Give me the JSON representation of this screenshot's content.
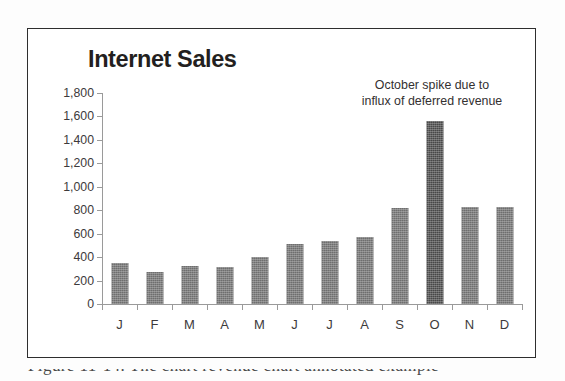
{
  "figure": {
    "frame_color": "#2e2e2e",
    "background": "#ffffff"
  },
  "caption": {
    "text": "Figure 11-14. The chart revenue chart annotated example"
  },
  "chart_data": {
    "type": "bar",
    "title": "Internet Sales",
    "xlabel": "",
    "ylabel": "",
    "categories": [
      "J",
      "F",
      "M",
      "A",
      "M",
      "J",
      "J",
      "A",
      "S",
      "O",
      "N",
      "D"
    ],
    "category_full_names": [
      "January",
      "February",
      "March",
      "April",
      "May",
      "June",
      "July",
      "August",
      "September",
      "October",
      "November",
      "December"
    ],
    "values": [
      350,
      270,
      325,
      320,
      405,
      510,
      535,
      570,
      820,
      1560,
      825,
      825
    ],
    "ylim": [
      0,
      1800
    ],
    "ytick_step": 200,
    "ytick_labels": [
      "1,800",
      "1,600",
      "1,400",
      "1,200",
      "1,000",
      "800",
      "600",
      "400",
      "200",
      "0"
    ],
    "ytick_values": [
      1800,
      1600,
      1400,
      1200,
      1000,
      800,
      600,
      400,
      200,
      0
    ],
    "grid": false,
    "legend": false,
    "bar_color": "#6e6e6e",
    "highlight_color": "#484848",
    "highlight_index": 9,
    "axis_color": "#9a9a9a",
    "annotations": [
      {
        "lines": [
          "October spike due to",
          "influx of deferred revenue"
        ],
        "target_category": "O"
      }
    ]
  }
}
